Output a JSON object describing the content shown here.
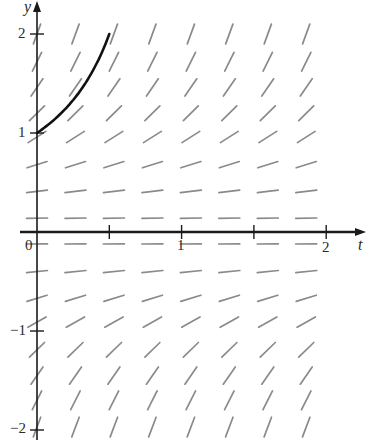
{
  "diagram": {
    "type": "slope_field",
    "differential_equation": "dy/dt = y^2",
    "axes": {
      "x_label": "t",
      "y_label": "y",
      "x_ticks": [
        {
          "value": 0,
          "label": "0"
        },
        {
          "value": 0.5,
          "label": ""
        },
        {
          "value": 1,
          "label": "1"
        },
        {
          "value": 1.5,
          "label": ""
        },
        {
          "value": 2,
          "label": "2"
        }
      ],
      "y_ticks": [
        {
          "value": 2,
          "label": "2"
        },
        {
          "value": 1,
          "label": "1"
        },
        {
          "value": -1,
          "label": "−1"
        },
        {
          "value": -2,
          "label": "−2"
        }
      ],
      "x_range": [
        0,
        2.25
      ],
      "y_range": [
        -2,
        2.3
      ]
    },
    "field": {
      "columns_t": [
        0,
        0.266,
        0.532,
        0.798,
        1.064,
        1.33,
        1.596,
        1.862
      ],
      "rows_y": [
        2.0,
        1.72,
        1.46,
        1.2,
        0.96,
        0.68,
        0.41,
        0.14,
        -0.12,
        -0.4,
        -0.67,
        -0.91,
        -1.19,
        -1.45,
        -1.7,
        -1.97
      ],
      "segment_color": "#8a8a8a"
    },
    "solution_curve": {
      "description": "y = 1/(1 - t), from (0, 1) to (0.5, 2)",
      "initial_point": {
        "t": 0,
        "y": 1
      },
      "end_point": {
        "t": 0.5,
        "y": 2
      },
      "color": "#111111"
    },
    "labels": {
      "y": "y",
      "t": "t",
      "tick_2": "2",
      "tick_1": "1",
      "tick_m1": "−1",
      "tick_m2": "−2",
      "tick_t0": "0",
      "tick_t1": "1",
      "tick_t2": "2"
    }
  }
}
